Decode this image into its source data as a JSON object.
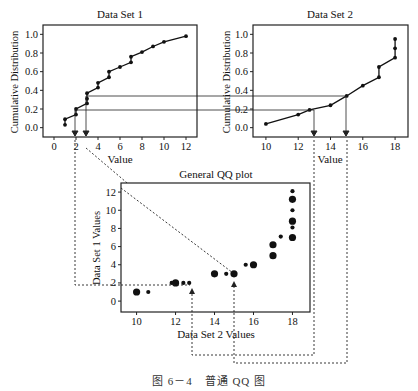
{
  "caption": "图 6－4　普通 QQ 图",
  "chart_data": [
    {
      "type": "line",
      "title": "Data Set 1",
      "xlabel": "Value",
      "ylabel": "Cumulative Distribution",
      "xticks": [
        0,
        2,
        4,
        6,
        8,
        10,
        12
      ],
      "yticks": [
        0.0,
        0.2,
        0.4,
        0.6,
        0.8,
        1.0
      ],
      "xlim": [
        -1,
        13
      ],
      "ylim": [
        -0.1,
        1.1
      ],
      "x": [
        1,
        1,
        2,
        2,
        3,
        3,
        3,
        4,
        4,
        5,
        5,
        6,
        7,
        7,
        8,
        9,
        10,
        12
      ],
      "y": [
        0.03,
        0.09,
        0.14,
        0.2,
        0.26,
        0.31,
        0.37,
        0.43,
        0.48,
        0.54,
        0.6,
        0.65,
        0.7,
        0.76,
        0.81,
        0.87,
        0.92,
        0.98
      ]
    },
    {
      "type": "line",
      "title": "Data Set 2",
      "xlabel": "Value",
      "ylabel": "Cumulative Distribution",
      "xticks": [
        10,
        12,
        14,
        16,
        18
      ],
      "yticks": [
        0.0,
        0.2,
        0.4,
        0.6,
        0.8,
        1.0
      ],
      "xlim": [
        9.2,
        18.8
      ],
      "ylim": [
        -0.1,
        1.1
      ],
      "x": [
        10,
        12,
        12.7,
        14,
        15,
        16,
        17,
        17,
        18,
        18,
        18
      ],
      "y": [
        0.04,
        0.14,
        0.19,
        0.24,
        0.34,
        0.45,
        0.54,
        0.65,
        0.75,
        0.85,
        0.95
      ]
    },
    {
      "type": "scatter",
      "title": "General QQ plot",
      "xlabel": "Data Set 2 Values",
      "ylabel": "Data Set 1 Values",
      "xticks": [
        10,
        12,
        14,
        16,
        18
      ],
      "yticks": [
        0,
        2,
        4,
        6,
        8,
        10,
        12
      ],
      "xlim": [
        9.2,
        18.9
      ],
      "ylim": [
        -1.2,
        13
      ],
      "points": [
        {
          "x": 10,
          "y": 1,
          "size": "large"
        },
        {
          "x": 10.6,
          "y": 1,
          "size": "small"
        },
        {
          "x": 11.8,
          "y": 2,
          "size": "small"
        },
        {
          "x": 12,
          "y": 2,
          "size": "large"
        },
        {
          "x": 12.4,
          "y": 2,
          "size": "small"
        },
        {
          "x": 12.7,
          "y": 2,
          "size": "small"
        },
        {
          "x": 14,
          "y": 3,
          "size": "large"
        },
        {
          "x": 14.6,
          "y": 3,
          "size": "small"
        },
        {
          "x": 15,
          "y": 3,
          "size": "large"
        },
        {
          "x": 15.6,
          "y": 4,
          "size": "small"
        },
        {
          "x": 16,
          "y": 4,
          "size": "large"
        },
        {
          "x": 17,
          "y": 5,
          "size": "large"
        },
        {
          "x": 17,
          "y": 6.2,
          "size": "large"
        },
        {
          "x": 17.4,
          "y": 7.1,
          "size": "small"
        },
        {
          "x": 18,
          "y": 7,
          "size": "large"
        },
        {
          "x": 18,
          "y": 8.1,
          "size": "small"
        },
        {
          "x": 18,
          "y": 8.8,
          "size": "large"
        },
        {
          "x": 18,
          "y": 10,
          "size": "small"
        },
        {
          "x": 18,
          "y": 11.2,
          "size": "large"
        },
        {
          "x": 18,
          "y": 12.1,
          "size": "small"
        }
      ]
    }
  ]
}
